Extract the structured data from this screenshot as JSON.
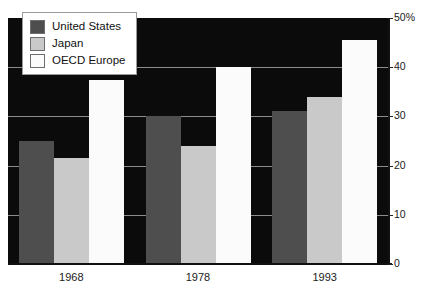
{
  "chart_data": {
    "type": "bar",
    "title": "",
    "xlabel": "",
    "ylabel": "",
    "categories": [
      "1968",
      "1978",
      "1993"
    ],
    "series": [
      {
        "name": "United States",
        "color": "#4e4e4e",
        "values": [
          25,
          30,
          31
        ]
      },
      {
        "name": "Japan",
        "color": "#c9c9c9",
        "values": [
          21.5,
          24,
          34
        ]
      },
      {
        "name": "OECD Europe",
        "color": "#fbfbfb",
        "values": [
          37.5,
          40,
          45.5
        ]
      }
    ],
    "ylim": [
      0,
      50
    ],
    "yticks": [
      {
        "value": 50,
        "label": "50%"
      },
      {
        "value": 40,
        "label": "40"
      },
      {
        "value": 30,
        "label": "30"
      },
      {
        "value": 20,
        "label": "20"
      },
      {
        "value": 10,
        "label": "10"
      },
      {
        "value": 0,
        "label": "0"
      }
    ],
    "grid": true,
    "grid_color": "#8c8c8c",
    "axis_position": "right",
    "legend_position": "top-left",
    "plot_background": "#0b0b0b"
  },
  "legend": {
    "items": [
      {
        "label": "United States",
        "swatch": "us"
      },
      {
        "label": "Japan",
        "swatch": "jp"
      },
      {
        "label": "OECD Europe",
        "swatch": "oecd"
      }
    ]
  }
}
